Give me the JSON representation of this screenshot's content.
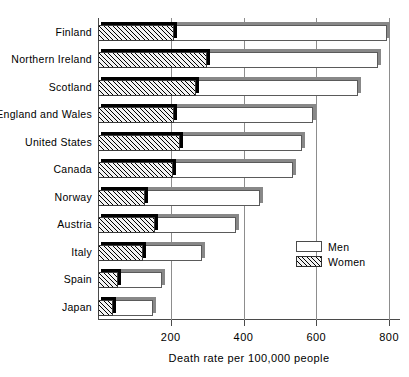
{
  "chart_data": {
    "type": "bar",
    "orientation": "horizontal",
    "title": "",
    "xlabel": "Death rate per 100,000 people",
    "ylabel": "",
    "xlim": [
      0,
      830
    ],
    "xticks": [
      200,
      400,
      600,
      800
    ],
    "grid": true,
    "legend_position": "right-middle",
    "categories": [
      "Finland",
      "Northern Ireland",
      "Scotland",
      "England and Wales",
      "United States",
      "Canada",
      "Norway",
      "Austria",
      "Italy",
      "Spain",
      "Japan"
    ],
    "series": [
      {
        "name": "Men",
        "values": [
          795,
          770,
          715,
          590,
          560,
          535,
          445,
          380,
          285,
          175,
          150
        ]
      },
      {
        "name": "Women",
        "values": [
          210,
          300,
          270,
          208,
          225,
          205,
          130,
          158,
          125,
          55,
          42
        ]
      }
    ]
  },
  "legend": {
    "men_label": "Men",
    "women_label": "Women"
  },
  "axis": {
    "tick_labels": [
      "200",
      "400",
      "600",
      "800"
    ],
    "x_title": "Death rate per 100,000 people"
  }
}
